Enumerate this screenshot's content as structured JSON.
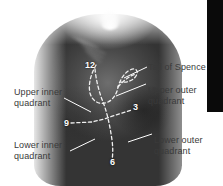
{
  "figure": {
    "type": "anatomical-photo-diagram",
    "background_color": "#ffffff"
  },
  "labels": {
    "tail_of_spence": "Tail of Spence",
    "upper_inner_quadrant": "Upper inner\nquadrant",
    "upper_outer_quadrant": "Upper outer\nquadrant",
    "lower_inner_quadrant": "Lower inner\nquadrant",
    "lower_outer_quadrant": "Lower outer\nquadrant"
  },
  "clock_positions": {
    "twelve": "12",
    "three": "3",
    "six": "6",
    "nine": "9"
  },
  "colors": {
    "label_text": "#ffffff",
    "dashed_guide": "#f2f2f2",
    "leader_line": "#ffffff",
    "black_bar": "#0a0a0a",
    "page_background": "#ffffff"
  },
  "decorations": {
    "black_bar_label": "right-edge-black-bar"
  }
}
